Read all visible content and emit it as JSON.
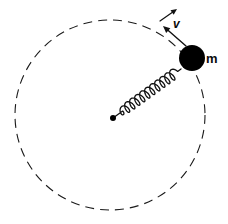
{
  "figure": {
    "background_color": "#ffffff",
    "stroke_color": "#111111",
    "width": 228,
    "height": 224
  },
  "orbit": {
    "name": "dashed-circular-path",
    "center_x": 110,
    "center_y": 115,
    "radius": 95,
    "style": "dashed",
    "dash_length": 9,
    "dash_gap": 6,
    "stroke_width": 1.1,
    "color": "#1a1a1a"
  },
  "pivot": {
    "name": "center-pivot-dot",
    "x": 113,
    "y": 118,
    "radius": 3,
    "color": "#000000"
  },
  "mass": {
    "name": "point-mass",
    "label": "m",
    "x": 192,
    "y": 58,
    "radius": 13,
    "color": "#000000",
    "label_x": 206,
    "label_y": 63
  },
  "spring": {
    "name": "coil-spring",
    "from_x": 113,
    "from_y": 118,
    "to_x": 181,
    "to_y": 69,
    "coils": 11,
    "amplitude": 5.2,
    "lead_in": 9,
    "lead_out": 7,
    "stroke_width": 1.3,
    "color": "#111111"
  },
  "velocity": {
    "name": "velocity-vector",
    "label": "v",
    "tail_x": 186,
    "tail_y": 46,
    "head_x": 163,
    "head_y": 26,
    "stroke_width": 1.4,
    "color": "#111111",
    "label_x": 173,
    "label_y": 28
  },
  "tangent_arrow": {
    "name": "tangent-direction-arrow",
    "start_x": 160,
    "start_y": 21,
    "end_x": 177,
    "end_y": 9,
    "stroke_width": 1.2,
    "color": "#111111"
  }
}
